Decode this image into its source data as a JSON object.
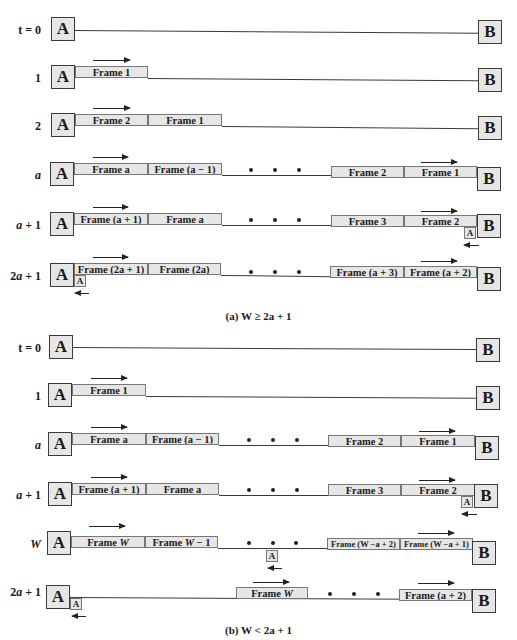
{
  "colors": {
    "box_fill": "#e6e6e6",
    "stroke": "#3a3a3a",
    "text": "#1a1a1a"
  },
  "stations": {
    "left": "A",
    "right": "B",
    "ack": "A"
  },
  "part_a": {
    "caption": "(a) W ≥ 2a + 1",
    "rows": [
      {
        "time": "t = 0",
        "frames": []
      },
      {
        "time": "1",
        "frames": [
          "Frame 1"
        ]
      },
      {
        "time": "2",
        "frames": [
          "Frame 2",
          "Frame 1"
        ]
      },
      {
        "time": "a",
        "left_frames": [
          "Frame a",
          "Frame (a − 1)"
        ],
        "right_frames": [
          "Frame 2",
          "Frame 1"
        ]
      },
      {
        "time": "a + 1",
        "left_frames": [
          "Frame (a + 1)",
          "Frame a"
        ],
        "right_frames": [
          "Frame 3",
          "Frame 2"
        ],
        "ack_at": "B"
      },
      {
        "time": "2a + 1",
        "left_frames": [
          "Frame (2a + 1)",
          "Frame (2a)"
        ],
        "right_frames": [
          "Frame (a + 3)",
          "Frame (a + 2)"
        ],
        "ack_at": "A"
      }
    ]
  },
  "part_b": {
    "caption": "(b) W < 2a + 1",
    "rows": [
      {
        "time": "t = 0",
        "frames": []
      },
      {
        "time": "1",
        "frames": [
          "Frame 1"
        ]
      },
      {
        "time": "a",
        "left_frames": [
          "Frame a",
          "Frame (a − 1)"
        ],
        "right_frames": [
          "Frame 2",
          "Frame 1"
        ]
      },
      {
        "time": "a + 1",
        "left_frames": [
          "Frame (a + 1)",
          "Frame a"
        ],
        "right_frames": [
          "Frame 3",
          "Frame 2"
        ],
        "ack_at": "B"
      },
      {
        "time": "W",
        "left_frames": [
          "Frame W",
          "Frame W − 1"
        ],
        "right_frames": [
          "Frame (W −a + 2)",
          "Frame (W −a + 1)"
        ],
        "ack_at": "middle"
      },
      {
        "time": "2a + 1",
        "mid_frames": [
          "Frame W"
        ],
        "right_frames": [
          "Frame (a + 2)"
        ],
        "ack_at": "A"
      }
    ]
  }
}
